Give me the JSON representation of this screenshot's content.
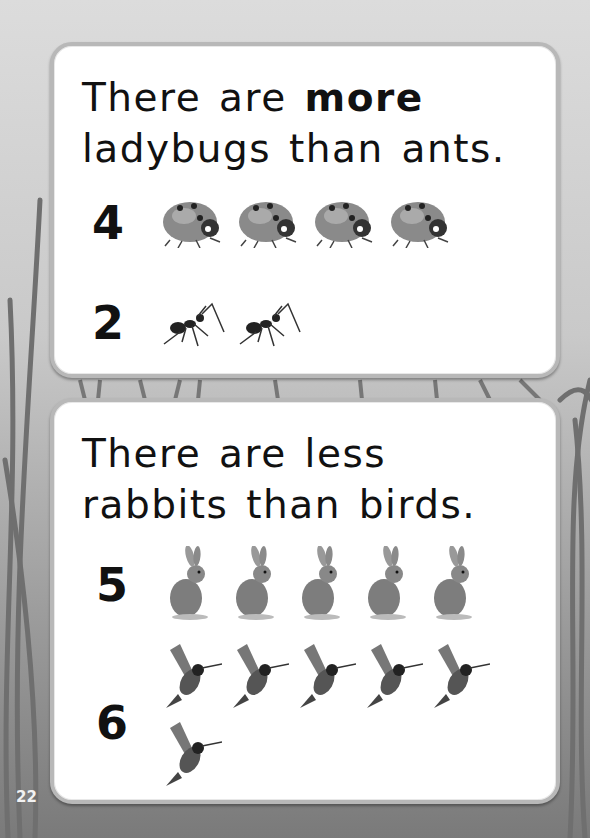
{
  "page_number": "22",
  "cards": [
    {
      "sentence": {
        "prefix": "There are ",
        "emphasis": "more",
        "suffix": "ladybugs than ants."
      },
      "groups": [
        {
          "count": "4",
          "animal": "ladybug",
          "icon": "ladybug-icon"
        },
        {
          "count": "2",
          "animal": "ant",
          "icon": "ant-icon"
        }
      ]
    },
    {
      "sentence": {
        "line1": "There are less",
        "line2": "rabbits than birds."
      },
      "groups": [
        {
          "count": "5",
          "animal": "rabbit",
          "icon": "rabbit-icon"
        },
        {
          "count": "6",
          "animal": "hummingbird",
          "icon": "hummingbird-icon"
        }
      ]
    }
  ],
  "colors": {
    "card_bg": "#ffffff",
    "card_border": "#b8b8b8",
    "text": "#111111",
    "page_number": "#f2f2f2"
  }
}
